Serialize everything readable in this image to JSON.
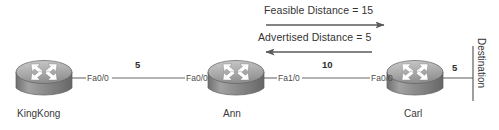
{
  "diagram": {
    "background_color": "#ffffff",
    "line_color": "#6b6b6b",
    "text_color": "#333333",
    "router_body_color": "#8f8f8f",
    "router_top_color": "#b9b9b9",
    "arrow_glyph_color": "#ffffff"
  },
  "annotations": [
    {
      "id": "feasible-distance",
      "text": "Feasible Distance = 15",
      "value": 15,
      "arrow_direction": "right",
      "arrow_from": "Ann",
      "arrow_to": "Carl"
    },
    {
      "id": "advertised-distance",
      "text": "Advertised Distance = 5",
      "value": 5,
      "arrow_direction": "left",
      "arrow_from": "Carl",
      "arrow_to": "Ann"
    }
  ],
  "routers": [
    {
      "id": "kingkong",
      "name": "KingKong",
      "icon": "router-icon"
    },
    {
      "id": "ann",
      "name": "Ann",
      "icon": "router-icon"
    },
    {
      "id": "carl",
      "name": "Carl",
      "icon": "router-icon"
    }
  ],
  "links": [
    {
      "id": "kingkong-ann",
      "left_interface": "Fa0/0",
      "right_interface": "Fa0/0",
      "cost": "5",
      "endpoints": [
        "KingKong",
        "Ann"
      ]
    },
    {
      "id": "ann-carl",
      "left_interface": "Fa1/0",
      "right_interface": "Fa0/0",
      "cost": "10",
      "endpoints": [
        "Ann",
        "Carl"
      ]
    },
    {
      "id": "carl-destination",
      "left_interface": "",
      "right_interface": "",
      "cost": "5",
      "endpoints": [
        "Carl",
        "Destination"
      ]
    }
  ],
  "destination": {
    "label": "Destination",
    "orientation": "vertical"
  }
}
